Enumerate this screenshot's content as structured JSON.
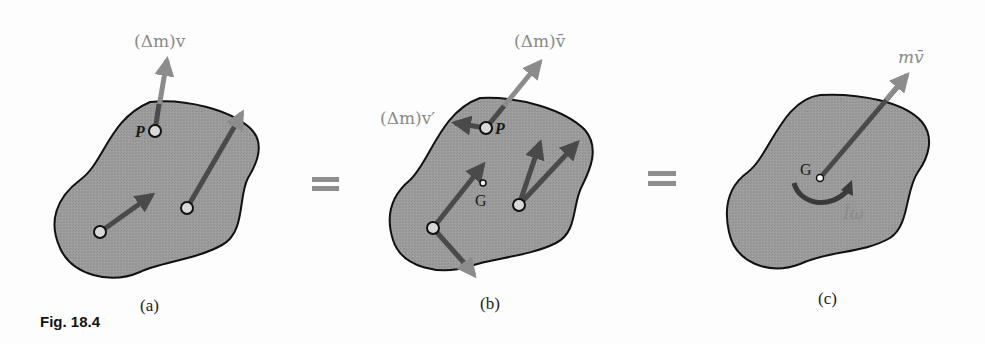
{
  "figure": {
    "caption": "Fig. 18.4",
    "colors": {
      "body_fill": "#9a9a9a",
      "body_stroke": "#111111",
      "vector_dark": "#4a4a4a",
      "vector_light": "#8c8c8c",
      "point_fill": "#d8d8d8",
      "label_gray": "#8a8a8a",
      "equals_sign": "#8e8e8e"
    },
    "equals_symbol": "=",
    "panels": [
      {
        "id": "a",
        "sub_label": "(a)",
        "vector_label": "(Δm)v",
        "point_label": "P",
        "description": "Rigid body with momenta (Δm)v of individual particles"
      },
      {
        "id": "b",
        "sub_label": "(b)",
        "vector_label_top": "(Δm)v̄",
        "vector_label_left": "(Δm)v′",
        "point_label": "P",
        "center_label": "G",
        "description": "Particle momenta decomposed into (Δm)v̄ and (Δm)v′"
      },
      {
        "id": "c",
        "sub_label": "(c)",
        "vector_label": "mv̄",
        "center_label": "G",
        "couple_label": "Īω",
        "description": "Equivalent system: linear momentum mv̄ at G and angular momentum Īω"
      }
    ]
  }
}
